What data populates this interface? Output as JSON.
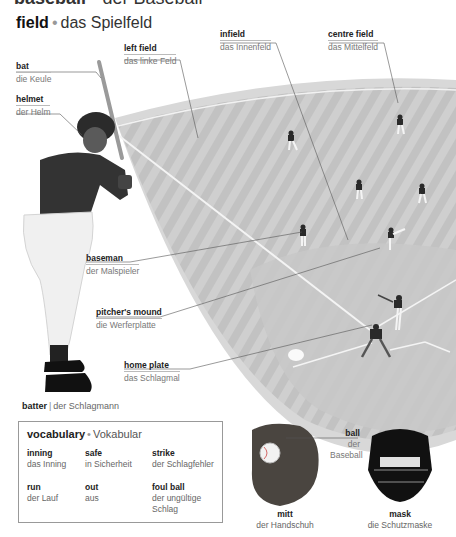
{
  "header": {
    "title_en": "baseball",
    "separator": "•",
    "title_de": "der Baseball"
  },
  "section": {
    "title_en": "field",
    "separator": "•",
    "title_de": "das Spielfeld"
  },
  "labels": {
    "bat": {
      "en": "bat",
      "de": "die Keule"
    },
    "helmet": {
      "en": "helmet",
      "de": "der Helm"
    },
    "left_field": {
      "en": "left field",
      "de": "das linke Feld"
    },
    "infield": {
      "en": "infield",
      "de": "das Innenfeld"
    },
    "centre_field": {
      "en": "centre field",
      "de": "das Mittelfeld"
    },
    "baseman": {
      "en": "baseman",
      "de": "der Malspieler"
    },
    "pitchers_mound": {
      "en": "pitcher's mound",
      "de": "die Werferplatte"
    },
    "home_plate": {
      "en": "home plate",
      "de": "das Schlagmal"
    },
    "ball": {
      "en": "ball",
      "de_line1": "der",
      "de_line2": "Baseball"
    },
    "mitt": {
      "en": "mitt",
      "de": "der Handschuh"
    },
    "mask": {
      "en": "mask",
      "de": "die Schutzmaske"
    }
  },
  "batter": {
    "en": "batter",
    "separator": "|",
    "de": "der Schlagmann"
  },
  "vocabulary": {
    "title_en": "vocabulary",
    "separator": "•",
    "title_de": "Vokabular",
    "items": [
      {
        "en": "inning",
        "de": "das Inning"
      },
      {
        "en": "safe",
        "de": "in Sicherheit"
      },
      {
        "en": "strike",
        "de": "der Schlagfehler"
      },
      {
        "en": "run",
        "de": "der Lauf"
      },
      {
        "en": "out",
        "de": "aus"
      },
      {
        "en": "foul ball",
        "de": "der ungültige Schlag"
      }
    ]
  }
}
